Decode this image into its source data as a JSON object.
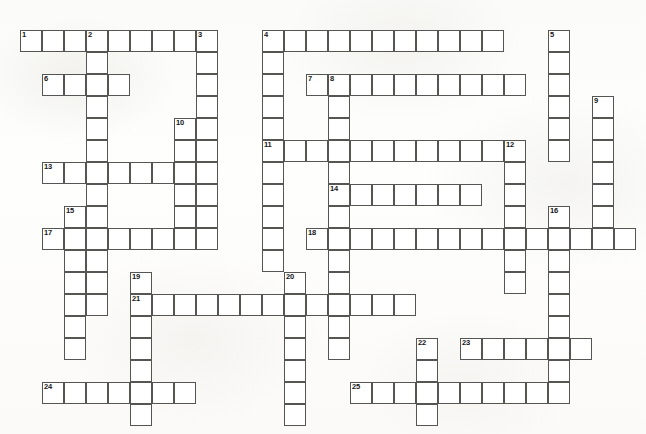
{
  "puzzle": {
    "title": "Crossword Puzzle Grid",
    "grid": {
      "cell_size": 22,
      "origin_x": 20,
      "origin_y": 30,
      "columns": 28,
      "rows": 18,
      "cell_fill_color": "#ffffff",
      "cell_border_color": "#555552",
      "background_color": "#fdfdfc",
      "number_color": "#161616"
    },
    "entries": [
      {
        "number": 1,
        "direction": "across",
        "row": 0,
        "col": 0,
        "length": 9
      },
      {
        "number": 2,
        "direction": "down",
        "row": 0,
        "col": 3,
        "length": 13
      },
      {
        "number": 3,
        "direction": "down",
        "row": 0,
        "col": 8,
        "length": 10
      },
      {
        "number": 4,
        "direction": "across",
        "row": 0,
        "col": 11,
        "length": 11
      },
      {
        "number": 4,
        "direction": "down",
        "row": 0,
        "col": 11,
        "length": 11
      },
      {
        "number": 5,
        "direction": "down",
        "row": 0,
        "col": 24,
        "length": 6
      },
      {
        "number": 6,
        "direction": "across",
        "row": 2,
        "col": 1,
        "length": 4
      },
      {
        "number": 7,
        "direction": "across",
        "row": 2,
        "col": 13,
        "length": 10
      },
      {
        "number": 8,
        "direction": "down",
        "row": 2,
        "col": 14,
        "length": 13
      },
      {
        "number": 9,
        "direction": "down",
        "row": 3,
        "col": 26,
        "length": 7
      },
      {
        "number": 10,
        "direction": "down",
        "row": 4,
        "col": 7,
        "length": 6
      },
      {
        "number": 11,
        "direction": "across",
        "row": 5,
        "col": 11,
        "length": 11
      },
      {
        "number": 12,
        "direction": "down",
        "row": 5,
        "col": 22,
        "length": 7
      },
      {
        "number": 13,
        "direction": "across",
        "row": 6,
        "col": 1,
        "length": 7
      },
      {
        "number": 14,
        "direction": "across",
        "row": 7,
        "col": 14,
        "length": 7
      },
      {
        "number": 15,
        "direction": "down",
        "row": 8,
        "col": 2,
        "length": 7
      },
      {
        "number": 16,
        "direction": "down",
        "row": 8,
        "col": 24,
        "length": 8
      },
      {
        "number": 17,
        "direction": "across",
        "row": 9,
        "col": 1,
        "length": 7
      },
      {
        "number": 18,
        "direction": "across",
        "row": 9,
        "col": 13,
        "length": 15
      },
      {
        "number": 19,
        "direction": "down",
        "row": 11,
        "col": 5,
        "length": 7
      },
      {
        "number": 20,
        "direction": "down",
        "row": 11,
        "col": 12,
        "length": 7
      },
      {
        "number": 21,
        "direction": "across",
        "row": 12,
        "col": 5,
        "length": 13
      },
      {
        "number": 22,
        "direction": "down",
        "row": 14,
        "col": 18,
        "length": 4
      },
      {
        "number": 23,
        "direction": "across",
        "row": 14,
        "col": 20,
        "length": 6
      },
      {
        "number": 24,
        "direction": "across",
        "row": 16,
        "col": 1,
        "length": 7
      },
      {
        "number": 25,
        "direction": "across",
        "row": 16,
        "col": 15,
        "length": 10
      }
    ],
    "extra_cells": [
      {
        "row": 0,
        "col": 1
      },
      {
        "row": 0,
        "col": 2
      },
      {
        "row": 0,
        "col": 4
      },
      {
        "row": 0,
        "col": 5
      },
      {
        "row": 0,
        "col": 6
      },
      {
        "row": 0,
        "col": 7
      },
      {
        "row": 0,
        "col": 12
      },
      {
        "row": 0,
        "col": 13
      },
      {
        "row": 0,
        "col": 14
      },
      {
        "row": 0,
        "col": 15
      },
      {
        "row": 0,
        "col": 16
      },
      {
        "row": 0,
        "col": 17
      },
      {
        "row": 0,
        "col": 18
      },
      {
        "row": 0,
        "col": 19
      },
      {
        "row": 0,
        "col": 20
      },
      {
        "row": 2,
        "col": 2
      },
      {
        "row": 2,
        "col": 4
      },
      {
        "row": 2,
        "col": 15
      },
      {
        "row": 2,
        "col": 16
      },
      {
        "row": 2,
        "col": 17
      },
      {
        "row": 2,
        "col": 18
      },
      {
        "row": 2,
        "col": 19
      },
      {
        "row": 2,
        "col": 20
      },
      {
        "row": 2,
        "col": 21
      },
      {
        "row": 2,
        "col": 22
      },
      {
        "row": 5,
        "col": 12
      },
      {
        "row": 5,
        "col": 13
      },
      {
        "row": 5,
        "col": 15
      },
      {
        "row": 5,
        "col": 16
      },
      {
        "row": 5,
        "col": 17
      },
      {
        "row": 5,
        "col": 18
      },
      {
        "row": 5,
        "col": 19
      },
      {
        "row": 5,
        "col": 20
      },
      {
        "row": 5,
        "col": 21
      },
      {
        "row": 6,
        "col": 2
      },
      {
        "row": 6,
        "col": 4
      },
      {
        "row": 6,
        "col": 5
      },
      {
        "row": 6,
        "col": 6
      },
      {
        "row": 7,
        "col": 15
      },
      {
        "row": 7,
        "col": 16
      },
      {
        "row": 7,
        "col": 17
      },
      {
        "row": 7,
        "col": 18
      },
      {
        "row": 7,
        "col": 19
      },
      {
        "row": 7,
        "col": 20
      },
      {
        "row": 9,
        "col": 4
      },
      {
        "row": 9,
        "col": 5
      },
      {
        "row": 9,
        "col": 6
      },
      {
        "row": 9,
        "col": 15
      },
      {
        "row": 9,
        "col": 16
      },
      {
        "row": 9,
        "col": 17
      },
      {
        "row": 9,
        "col": 18
      },
      {
        "row": 9,
        "col": 19
      },
      {
        "row": 9,
        "col": 20
      },
      {
        "row": 9,
        "col": 21
      },
      {
        "row": 9,
        "col": 23
      },
      {
        "row": 9,
        "col": 25
      },
      {
        "row": 9,
        "col": 26
      },
      {
        "row": 9,
        "col": 27
      },
      {
        "row": 12,
        "col": 6
      },
      {
        "row": 12,
        "col": 7
      },
      {
        "row": 12,
        "col": 8
      },
      {
        "row": 12,
        "col": 9
      },
      {
        "row": 12,
        "col": 10
      },
      {
        "row": 12,
        "col": 11
      },
      {
        "row": 12,
        "col": 13
      },
      {
        "row": 12,
        "col": 15
      },
      {
        "row": 12,
        "col": 16
      },
      {
        "row": 12,
        "col": 17
      },
      {
        "row": 14,
        "col": 21
      },
      {
        "row": 14,
        "col": 22
      },
      {
        "row": 14,
        "col": 23
      },
      {
        "row": 14,
        "col": 25
      },
      {
        "row": 16,
        "col": 2
      },
      {
        "row": 16,
        "col": 3
      },
      {
        "row": 16,
        "col": 4
      },
      {
        "row": 16,
        "col": 6
      },
      {
        "row": 16,
        "col": 7
      },
      {
        "row": 16,
        "col": 16
      },
      {
        "row": 16,
        "col": 17
      },
      {
        "row": 16,
        "col": 18
      },
      {
        "row": 16,
        "col": 19
      },
      {
        "row": 16,
        "col": 20
      },
      {
        "row": 16,
        "col": 21
      },
      {
        "row": 16,
        "col": 22
      },
      {
        "row": 16,
        "col": 23
      },
      {
        "row": 16,
        "col": 24
      }
    ]
  }
}
